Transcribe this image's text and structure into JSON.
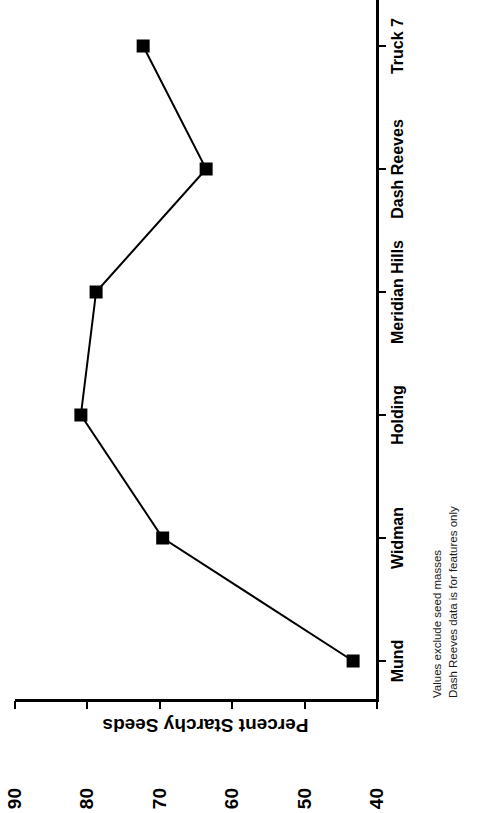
{
  "chart_data": {
    "type": "line",
    "title": "",
    "xlabel": "",
    "ylabel": "Percent Starchy Seeds",
    "categories": [
      "Mund",
      "Widman",
      "Holding",
      "Meridian Hills",
      "Dash Reeves",
      "Truck 7"
    ],
    "values": [
      43.3,
      69.6,
      80.9,
      78.8,
      63.6,
      72.3
    ],
    "ytick_labels": [
      "40",
      "50",
      "60",
      "70",
      "80",
      "90"
    ],
    "ylim": [
      40,
      90
    ],
    "grid": false,
    "legend": false,
    "marker": "filled-square",
    "line_color": "#000000",
    "marker_color": "#000000",
    "orientation": "rotated-90-ccw",
    "annotations": [
      "Values exclude seed masses",
      "Dash Reeves data is for features only"
    ]
  }
}
